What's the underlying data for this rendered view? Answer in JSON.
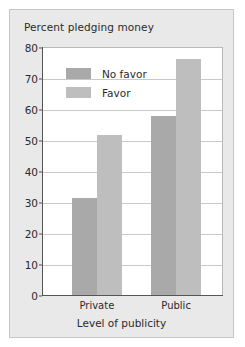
{
  "chart_data": {
    "type": "bar",
    "title": "Percent pledging money",
    "xlabel": "Level of publicity",
    "ylabel": "",
    "categories": [
      "Private",
      "Public"
    ],
    "series": [
      {
        "name": "No favor",
        "values": [
          31.5,
          58
        ],
        "color": "#a9a9a9"
      },
      {
        "name": "Favor",
        "values": [
          52,
          76.5
        ],
        "color": "#bebebe"
      }
    ],
    "ylim": [
      0,
      80
    ],
    "ytick_values": [
      0,
      10,
      20,
      30,
      40,
      50,
      60,
      70,
      80
    ],
    "ytick_labels": [
      "0",
      "10",
      "20",
      "30",
      "40",
      "50",
      "60",
      "70",
      "80"
    ],
    "grid": true,
    "legend_position": "upper-left-inside",
    "panel_background": "#e9e9e9",
    "plot_background": "#ffffff",
    "gridline_color": "#c9c9c9",
    "axis_color": "#555555",
    "text_color": "#2b2b2b"
  }
}
